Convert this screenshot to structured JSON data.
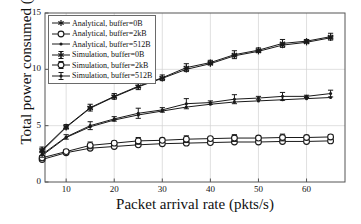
{
  "chart_data": {
    "type": "line",
    "title": "",
    "xlabel": "Packet arrival rate (pkts/s)",
    "ylabel": "Total power consumed (mW)",
    "xlim": [
      5.6,
      68
    ],
    "ylim": [
      0,
      15
    ],
    "xticks": [
      10,
      20,
      30,
      40,
      50,
      60
    ],
    "yticks": [
      0,
      5,
      10,
      15
    ],
    "grid": true,
    "legend_position": "upper left",
    "x": [
      5,
      10,
      15,
      20,
      25,
      30,
      35,
      40,
      45,
      50,
      55,
      60,
      65
    ],
    "series": [
      {
        "name": "Analytical, buffer=0B",
        "marker": "asterisk",
        "style": "line",
        "values": [
          2.75,
          4.85,
          6.55,
          7.55,
          8.45,
          9.2,
          10.0,
          10.5,
          11.2,
          11.6,
          12.15,
          12.4,
          12.8
        ]
      },
      {
        "name": "Analytical, buffer=2kB",
        "marker": "circle-open",
        "style": "line",
        "values": [
          2.0,
          2.6,
          3.0,
          3.15,
          3.3,
          3.4,
          3.45,
          3.5,
          3.55,
          3.55,
          3.6,
          3.6,
          3.65
        ]
      },
      {
        "name": "Analytical, buffer=512B",
        "marker": "dot",
        "style": "line",
        "values": [
          2.35,
          3.95,
          4.9,
          5.5,
          5.95,
          6.3,
          6.65,
          6.9,
          7.1,
          7.2,
          7.3,
          7.4,
          7.5
        ]
      },
      {
        "name": "Simulation, buffer=0B",
        "marker": "asterisk-err",
        "style": "errorbar",
        "values": [
          2.85,
          4.9,
          6.6,
          7.6,
          8.5,
          9.25,
          10.15,
          10.6,
          11.3,
          11.7,
          12.3,
          12.5,
          12.9
        ],
        "errors": [
          0.25,
          0.2,
          0.3,
          0.25,
          0.3,
          0.25,
          0.35,
          0.2,
          0.35,
          0.2,
          0.35,
          0.15,
          0.3
        ]
      },
      {
        "name": "Simulation, buffer=2kB",
        "marker": "circle-err",
        "style": "errorbar",
        "values": [
          2.15,
          2.7,
          3.25,
          3.45,
          3.65,
          3.7,
          3.8,
          3.85,
          3.9,
          3.9,
          3.95,
          3.95,
          4.0
        ],
        "errors": [
          0.2,
          0.15,
          0.3,
          0.15,
          0.3,
          0.15,
          0.3,
          0.1,
          0.3,
          0.1,
          0.3,
          0.1,
          0.2
        ]
      },
      {
        "name": "Simulation, buffer=512B",
        "marker": "dot-err",
        "style": "errorbar",
        "values": [
          2.45,
          4.0,
          5.0,
          5.6,
          6.1,
          6.4,
          6.95,
          7.05,
          7.35,
          7.45,
          7.6,
          7.6,
          7.85
        ],
        "errors": [
          0.25,
          0.2,
          0.35,
          0.2,
          0.45,
          0.2,
          0.45,
          0.15,
          0.4,
          0.15,
          0.35,
          0.1,
          0.3
        ]
      }
    ]
  },
  "axes": {
    "y_tick_labels": [
      "0",
      "5",
      "10",
      "15"
    ],
    "x_tick_labels": [
      "10",
      "20",
      "30",
      "40",
      "50",
      "60"
    ],
    "xlabel": "Packet arrival rate (pkts/s)",
    "ylabel": "Total power consumed (mW)"
  },
  "legend": {
    "items": [
      {
        "label": "Analytical, buffer=0B",
        "marker": "asterisk"
      },
      {
        "label": "Analytical, buffer=2kB",
        "marker": "circle-open"
      },
      {
        "label": "Analytical, buffer=512B",
        "marker": "dot"
      },
      {
        "label": "Simulation, buffer=0B",
        "marker": "asterisk-err"
      },
      {
        "label": "Simulation, buffer=2kB",
        "marker": "circle-err"
      },
      {
        "label": "Simulation, buffer=512B",
        "marker": "dot-err"
      }
    ]
  },
  "colors": {
    "line": "#1a1a1a",
    "grid": "#d2d2d2",
    "axis": "#555555",
    "background": "#ffffff"
  }
}
